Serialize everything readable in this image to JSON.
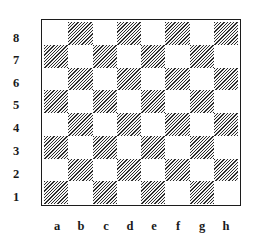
{
  "board": {
    "files": [
      "a",
      "b",
      "c",
      "d",
      "e",
      "f",
      "g",
      "h"
    ],
    "ranks": [
      "8",
      "7",
      "6",
      "5",
      "4",
      "3",
      "2",
      "1"
    ],
    "light_square_style": "plain white",
    "dark_square_style": "diagonal hatching",
    "rows": [
      [
        "light",
        "dark",
        "light",
        "dark",
        "light",
        "dark",
        "light",
        "dark"
      ],
      [
        "dark",
        "light",
        "dark",
        "light",
        "dark",
        "light",
        "dark",
        "light"
      ],
      [
        "light",
        "dark",
        "light",
        "dark",
        "light",
        "dark",
        "light",
        "dark"
      ],
      [
        "dark",
        "light",
        "dark",
        "light",
        "dark",
        "light",
        "dark",
        "light"
      ],
      [
        "light",
        "dark",
        "light",
        "dark",
        "light",
        "dark",
        "light",
        "dark"
      ],
      [
        "dark",
        "light",
        "dark",
        "light",
        "dark",
        "light",
        "dark",
        "light"
      ],
      [
        "light",
        "dark",
        "light",
        "dark",
        "light",
        "dark",
        "light",
        "dark"
      ],
      [
        "dark",
        "light",
        "dark",
        "light",
        "dark",
        "light",
        "dark",
        "light"
      ]
    ],
    "pieces": []
  },
  "colors": {
    "background": "#ffffff",
    "border": "#1c1c1c",
    "hatch_line": "#2b2b2b",
    "light_square": "#ffffff",
    "label_text": "#1a1a1a"
  }
}
